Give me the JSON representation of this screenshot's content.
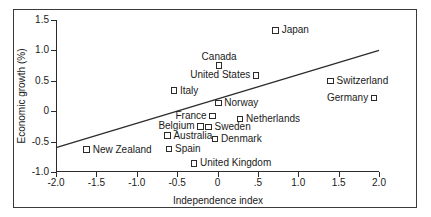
{
  "chart_data": {
    "type": "scatter",
    "title": "",
    "xlabel": "Independence index",
    "ylabel": "Economic growth (%)",
    "xlim": [
      -2.0,
      2.0
    ],
    "ylim": [
      -1.0,
      1.5
    ],
    "grid": false,
    "legend": "none",
    "x_ticks": [
      "-2.0",
      "-1.5",
      "-1.0",
      "-0.5",
      "0",
      ".5",
      "1.0",
      "1.5",
      "2.0"
    ],
    "x_tick_values": [
      -2.0,
      -1.5,
      -1.0,
      -0.5,
      0,
      0.5,
      1.0,
      1.5,
      2.0
    ],
    "y_ticks": [
      "1.5",
      "1.0",
      "0.5",
      "0",
      "-0.5",
      "-1.0"
    ],
    "y_tick_values": [
      1.5,
      1.0,
      0.5,
      0,
      -0.5,
      -1.0
    ],
    "points": [
      {
        "label": "Japan",
        "x": 0.72,
        "y": 1.33,
        "label_pos": "right"
      },
      {
        "label": "Canada",
        "x": 0.02,
        "y": 0.75,
        "label_pos": "above"
      },
      {
        "label": "United States",
        "x": 0.48,
        "y": 0.59,
        "label_pos": "left"
      },
      {
        "label": "Switzerland",
        "x": 1.4,
        "y": 0.5,
        "label_pos": "right"
      },
      {
        "label": "Italy",
        "x": -0.54,
        "y": 0.34,
        "label_pos": "right"
      },
      {
        "label": "Germany",
        "x": 1.94,
        "y": 0.22,
        "label_pos": "left"
      },
      {
        "label": "Norway",
        "x": 0.01,
        "y": 0.13,
        "label_pos": "right"
      },
      {
        "label": "France",
        "x": -0.06,
        "y": -0.08,
        "label_pos": "left"
      },
      {
        "label": "Netherlands",
        "x": 0.28,
        "y": -0.13,
        "label_pos": "right"
      },
      {
        "label": "Belgium",
        "x": -0.21,
        "y": -0.25,
        "label_pos": "left"
      },
      {
        "label": "Sweden",
        "x": -0.11,
        "y": -0.26,
        "label_pos": "right"
      },
      {
        "label": "Australia",
        "x": -0.62,
        "y": -0.4,
        "label_pos": "right"
      },
      {
        "label": "Denmark",
        "x": -0.03,
        "y": -0.46,
        "label_pos": "right"
      },
      {
        "label": "Spain",
        "x": -0.6,
        "y": -0.62,
        "label_pos": "right"
      },
      {
        "label": "New Zealand",
        "x": -1.62,
        "y": -0.63,
        "label_pos": "right"
      },
      {
        "label": "United Kingdom",
        "x": -0.29,
        "y": -0.86,
        "label_pos": "right"
      }
    ],
    "trendline": {
      "x1": -2.0,
      "y1": -0.6,
      "x2": 2.0,
      "y2": 1.0,
      "color": "#2b2b2b"
    },
    "colors": {
      "axis": "#2b2b2b",
      "frame": "#3a3a3a",
      "marker_fill": "#ffffff",
      "marker_edge": "#2b2b2b",
      "text": "#1a1a1a",
      "background": "#ffffff"
    }
  }
}
